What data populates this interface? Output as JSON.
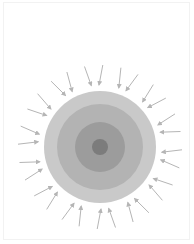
{
  "diagram": {
    "center": {
      "x": 100,
      "y": 147
    },
    "rings": [
      {
        "name": "outer-layer",
        "radius": 56,
        "color": "#c9c9c9"
      },
      {
        "name": "second-layer",
        "radius": 43,
        "color": "#b3b3b3"
      },
      {
        "name": "third-layer",
        "radius": 25,
        "color": "#9c9c9c"
      },
      {
        "name": "core",
        "radius": 8,
        "color": "#7c7c7c"
      }
    ],
    "arrows": {
      "count": 28,
      "start_radius": 82,
      "end_radius": 62,
      "color": "#b5b5b5",
      "direction": "inward"
    }
  }
}
